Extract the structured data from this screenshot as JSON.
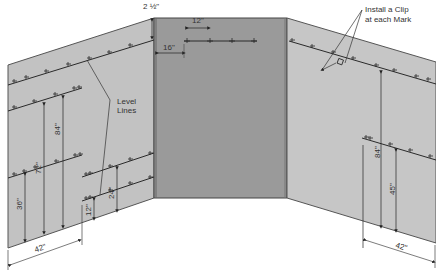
{
  "diagram": {
    "colors": {
      "left_wall": "#c2c2c2",
      "back_wall": "#9a9a9a",
      "right_wall": "#c6c6c6",
      "line": "#2a2a2a",
      "text": "#333333"
    },
    "annotations": {
      "top_offset": "2 ½\"",
      "spacing_12": "12\"",
      "spacing_16": "16\"",
      "install_clip_line1": "Install a Clip",
      "install_clip_line2": "at each Mark",
      "level_lines_line1": "Level",
      "level_lines_line2": "Lines"
    },
    "left_wall": {
      "dims_vertical": [
        "36\"",
        "72\"",
        "84\"",
        "12\"",
        "24\""
      ],
      "dim_horizontal": "42\""
    },
    "right_wall": {
      "dims_vertical": [
        "84\"",
        "45\""
      ],
      "dim_horizontal": "42\""
    }
  }
}
